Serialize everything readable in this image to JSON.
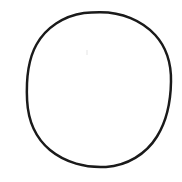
{
  "image": {
    "kind": "line-drawing",
    "subject": "circle",
    "description": "A single hand-drawn circle outline on a plain white background",
    "width_px": 182,
    "height_px": 182,
    "background_color": "#ffffff",
    "text_content": "",
    "label": ""
  },
  "shapes": [
    {
      "name": "circle-outline",
      "type": "ellipse",
      "center_x": 99,
      "center_y": 89.5,
      "radius_x": 72,
      "radius_y": 77.5,
      "stroke_color": "#1a1a1a",
      "stroke_width_px": 2.5,
      "fill": "none",
      "bbox": {
        "left": 27,
        "top": 12,
        "right": 171,
        "bottom": 167
      }
    }
  ],
  "artifacts": [
    {
      "name": "scan-speck",
      "color": "#f2f2f2",
      "x": 86,
      "y": 50,
      "width": 2,
      "height": 5
    }
  ]
}
